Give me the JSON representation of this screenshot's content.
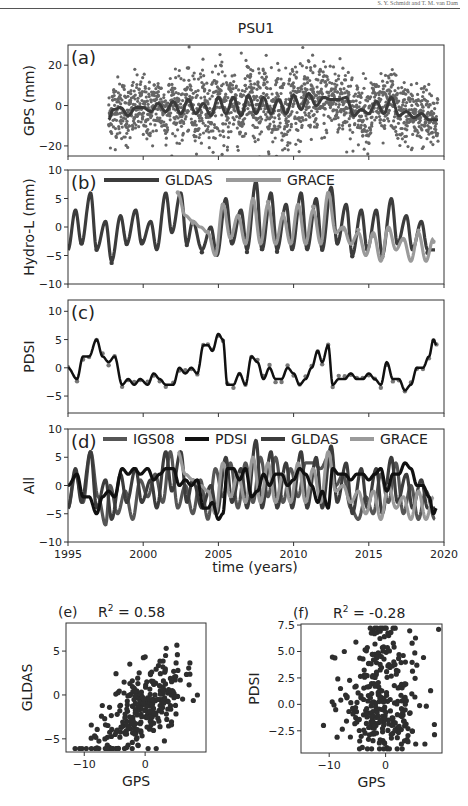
{
  "header": {
    "running_text": "S. Y. Schmidt and T. M. van Dam"
  },
  "figure": {
    "title": "PSU1",
    "xlabel_time": "time (years)",
    "colors": {
      "gps_dots": "#666666",
      "gps_fit": "#3a3a3a",
      "gldas": "#3c3c3c",
      "grace": "#9a9a9a",
      "pdsi": "#111111",
      "pdsi_dots": "#777777",
      "igs08": "#555555",
      "scatter": "#2e2e2e"
    }
  },
  "chart_data": [
    {
      "id": "a",
      "type": "scatter",
      "panel_label": "(a)",
      "title": "PSU1",
      "ylabel": "GPS (mm)",
      "xlabel": "",
      "xlim": [
        1995,
        2020
      ],
      "ylim": [
        -25,
        30
      ],
      "yticks": [
        -20,
        0,
        20
      ],
      "xticks": [
        1995,
        2000,
        2005,
        2010,
        2015,
        2020
      ],
      "series": [
        {
          "name": "GPS daily",
          "style": "dots",
          "x_range": [
            1997.7,
            2019.6
          ],
          "spread_mm": 9
        },
        {
          "name": "GPS smoothed",
          "style": "line",
          "x": [
            1997.7,
            1998.0,
            1998.5,
            1999.0,
            1999.5,
            2000.0,
            2000.5,
            2001.0,
            2001.5,
            2002.0,
            2002.5,
            2003.0,
            2003.5,
            2004.0,
            2004.5,
            2005.0,
            2005.5,
            2006.0,
            2006.5,
            2007.0,
            2007.5,
            2008.0,
            2008.5,
            2009.0,
            2009.5,
            2010.0,
            2010.5,
            2011.0,
            2011.5,
            2012.0,
            2012.5,
            2013.0,
            2013.5,
            2014.0,
            2014.5,
            2015.0,
            2015.5,
            2016.0,
            2016.5,
            2017.0,
            2017.5,
            2018.0,
            2018.5,
            2019.0,
            2019.6
          ],
          "y": [
            -7,
            -2,
            -1,
            -5,
            -1,
            -1,
            -3,
            1,
            -3,
            2,
            -4,
            3,
            -4,
            1,
            -5,
            4,
            -4,
            4,
            -5,
            5,
            -4,
            4,
            -4,
            3,
            -4,
            5,
            -2,
            6,
            0,
            4,
            3,
            3,
            4,
            -5,
            -2,
            -4,
            2,
            -4,
            4,
            -5,
            -3,
            -6,
            -4,
            -7,
            -7
          ]
        }
      ],
      "grid": false
    },
    {
      "id": "b",
      "type": "line",
      "panel_label": "(b)",
      "ylabel": "Hydro-L (mm)",
      "xlim": [
        1995,
        2020
      ],
      "ylim": [
        -10,
        10
      ],
      "yticks": [
        -10,
        -5,
        0,
        5,
        10
      ],
      "xticks": [
        1995,
        2000,
        2005,
        2010,
        2015,
        2020
      ],
      "legend": {
        "entries": [
          "GLDAS",
          "GRACE"
        ],
        "position": "top"
      },
      "series": [
        {
          "name": "GLDAS",
          "x": [
            1995.0,
            1995.5,
            1995.9,
            1996.5,
            1996.9,
            1997.5,
            1997.9,
            1998.5,
            1998.9,
            1999.5,
            1999.9,
            2000.5,
            2000.9,
            2001.5,
            2001.9,
            2002.5,
            2002.9,
            2003.3,
            2003.9,
            2004.5,
            2004.9,
            2005.5,
            2005.9,
            2006.5,
            2006.9,
            2007.5,
            2007.9,
            2008.5,
            2008.9,
            2009.5,
            2009.9,
            2010.5,
            2010.9,
            2011.5,
            2011.9,
            2012.5,
            2012.9,
            2013.5,
            2013.9,
            2014.5,
            2014.9,
            2015.5,
            2015.9,
            2016.5,
            2016.9,
            2017.5,
            2017.9,
            2018.5,
            2018.9,
            2019.4
          ],
          "y": [
            -4,
            3,
            -3,
            6,
            -4,
            1,
            -6,
            2,
            -3,
            3,
            -3,
            1,
            -4,
            6,
            -1,
            6,
            -3,
            1,
            -4,
            0,
            -5,
            5,
            -3,
            3,
            -4,
            8,
            -4,
            6,
            -4,
            4,
            -4,
            6,
            -4,
            5,
            -4,
            7,
            -3,
            4,
            -5,
            3,
            -4,
            3,
            -5,
            5,
            -3,
            2,
            -4,
            1,
            -4,
            -4
          ]
        },
        {
          "name": "GRACE",
          "x": [
            2002.3,
            2002.8,
            2003.3,
            2003.8,
            2004.3,
            2004.8,
            2005.3,
            2005.8,
            2006.3,
            2006.8,
            2007.3,
            2007.8,
            2008.3,
            2008.8,
            2009.3,
            2009.8,
            2010.3,
            2010.8,
            2011.3,
            2011.8,
            2012.3,
            2012.8,
            2013.3,
            2013.8,
            2014.3,
            2014.8,
            2015.3,
            2015.8,
            2016.3,
            2016.8,
            2017.3,
            2017.8,
            2018.3,
            2018.8,
            2019.3
          ],
          "y": [
            6,
            2,
            1,
            0,
            -1,
            -5,
            4,
            -2,
            2,
            -3,
            5,
            -3,
            4,
            -3,
            2,
            -3,
            4,
            -3,
            3,
            -3,
            6,
            -1,
            0,
            -3,
            -1,
            -5,
            -1,
            -6,
            0,
            -4,
            -2,
            -6,
            -1,
            -6,
            -2
          ]
        }
      ]
    },
    {
      "id": "c",
      "type": "line",
      "panel_label": "(c)",
      "ylabel": "PDSI",
      "xlim": [
        1995,
        2020
      ],
      "ylim": [
        -8,
        12
      ],
      "yticks": [
        -5,
        0,
        5,
        10
      ],
      "xticks": [
        1995,
        2000,
        2005,
        2010,
        2015,
        2020
      ],
      "series": [
        {
          "name": "PDSI",
          "x": [
            1995.0,
            1995.6,
            1996.0,
            1996.4,
            1996.9,
            1997.3,
            1997.7,
            1998.1,
            1998.6,
            1999.0,
            1999.4,
            1999.8,
            2000.3,
            2000.7,
            2001.1,
            2001.5,
            2002.0,
            2002.4,
            2002.8,
            2003.2,
            2003.6,
            2004.0,
            2004.3,
            2004.6,
            2005.0,
            2005.3,
            2005.6,
            2006.0,
            2006.4,
            2006.8,
            2007.2,
            2007.6,
            2008.0,
            2008.4,
            2008.8,
            2009.2,
            2009.6,
            2010.0,
            2010.4,
            2010.8,
            2011.2,
            2011.6,
            2011.9,
            2012.3,
            2012.6,
            2013.0,
            2013.4,
            2013.8,
            2014.2,
            2014.6,
            2015.0,
            2015.4,
            2015.8,
            2016.2,
            2016.6,
            2017.0,
            2017.4,
            2017.8,
            2018.2,
            2018.6,
            2019.0,
            2019.3,
            2019.5
          ],
          "y": [
            0,
            -2,
            2,
            2,
            5,
            2,
            1,
            2,
            -3,
            -2,
            -3,
            -2,
            -3,
            -1,
            -2,
            -3,
            -3,
            0,
            -1,
            0,
            -1,
            4,
            4,
            3,
            6,
            5,
            -3,
            -3,
            -1,
            -3,
            2,
            1,
            -2,
            0,
            -2,
            -2,
            0,
            -1,
            -3,
            -2,
            0,
            3,
            1,
            4,
            -3,
            -2,
            -2,
            -1,
            -2,
            -2,
            -1,
            -2,
            -3,
            1,
            -2,
            -2,
            -4,
            -3,
            0,
            0,
            2,
            5,
            4
          ]
        }
      ]
    },
    {
      "id": "d",
      "type": "line",
      "panel_label": "(d)",
      "ylabel": "All",
      "xlabel": "time (years)",
      "xlim": [
        1995,
        2020
      ],
      "ylim": [
        -10,
        10
      ],
      "yticks": [
        -10,
        -5,
        0,
        5,
        10
      ],
      "xticks": [
        1995,
        2000,
        2005,
        2010,
        2015,
        2020
      ],
      "xticklabels": [
        "1995",
        "2000",
        "2005",
        "2010",
        "2015",
        "2020"
      ],
      "legend": {
        "entries": [
          "IGS08",
          "PDSI",
          "GLDAS",
          "GRACE"
        ],
        "position": "top"
      },
      "series": [
        {
          "name": "IGS08",
          "x": [
            1995.0,
            1995.5,
            1996.0,
            1996.5,
            1997.0,
            1997.5,
            1997.8,
            1998.3,
            1998.8,
            1999.3,
            1999.8,
            2000.3,
            2000.8,
            2001.3,
            2001.8,
            2002.3,
            2002.8,
            2003.3,
            2003.8,
            2004.3,
            2004.8,
            2005.3,
            2005.8,
            2006.3,
            2006.8,
            2007.3,
            2007.8,
            2008.3,
            2008.8,
            2009.3,
            2009.8,
            2010.3,
            2010.8,
            2011.3,
            2011.8,
            2012.3,
            2012.8,
            2013.3,
            2013.8,
            2014.3,
            2014.8,
            2015.3,
            2015.8,
            2016.3,
            2016.8,
            2017.3,
            2017.8,
            2018.3,
            2018.8,
            2019.4
          ],
          "y": [
            -4,
            2,
            -3,
            6,
            -2,
            -7,
            0,
            -5,
            -1,
            -6,
            1,
            -2,
            2,
            -3,
            6,
            -4,
            0,
            -5,
            1,
            -6,
            3,
            -2,
            4,
            -4,
            4,
            -3,
            5,
            -2,
            5,
            -3,
            3,
            -2,
            4,
            4,
            3,
            5,
            0,
            2,
            -4,
            -6,
            -2,
            -5,
            2,
            -3,
            4,
            -5,
            0,
            -6,
            -1,
            -6
          ]
        },
        {
          "name": "PDSI",
          "x": [
            1995.0,
            1995.6,
            1996.0,
            1996.4,
            1996.9,
            1997.3,
            1997.7,
            1998.1,
            1998.6,
            1999.0,
            1999.4,
            1999.8,
            2000.3,
            2000.7,
            2001.1,
            2001.5,
            2002.0,
            2002.4,
            2002.8,
            2003.2,
            2003.6,
            2004.0,
            2004.3,
            2004.6,
            2005.0,
            2005.3,
            2005.6,
            2006.0,
            2006.4,
            2006.8,
            2007.2,
            2007.6,
            2008.0,
            2008.4,
            2008.8,
            2009.2,
            2009.6,
            2010.0,
            2010.4,
            2010.8,
            2011.2,
            2011.6,
            2011.9,
            2012.3,
            2012.6,
            2013.0,
            2013.4,
            2013.8,
            2014.2,
            2014.6,
            2015.0,
            2015.4,
            2015.8,
            2016.2,
            2016.6,
            2017.0,
            2017.4,
            2017.8,
            2018.2,
            2018.6,
            2019.0,
            2019.3,
            2019.5
          ],
          "y": [
            0,
            2,
            -2,
            -2,
            -5,
            -2,
            -1,
            -2,
            3,
            2,
            3,
            2,
            3,
            1,
            2,
            3,
            3,
            0,
            1,
            0,
            1,
            -4,
            -4,
            -3,
            -6,
            -5,
            3,
            3,
            1,
            3,
            -2,
            -1,
            2,
            0,
            2,
            2,
            0,
            1,
            3,
            2,
            0,
            -3,
            -1,
            -4,
            3,
            2,
            2,
            1,
            2,
            2,
            1,
            2,
            3,
            -1,
            2,
            2,
            4,
            3,
            0,
            0,
            -2,
            -5,
            -4
          ]
        },
        {
          "name": "GLDAS",
          "x": [
            1995.0,
            1995.5,
            1995.9,
            1996.5,
            1996.9,
            1997.5,
            1997.9,
            1998.5,
            1998.9,
            1999.5,
            1999.9,
            2000.5,
            2000.9,
            2001.5,
            2001.9,
            2002.5,
            2002.9,
            2003.3,
            2003.9,
            2004.5,
            2004.9,
            2005.5,
            2005.9,
            2006.5,
            2006.9,
            2007.5,
            2007.9,
            2008.5,
            2008.9,
            2009.5,
            2009.9,
            2010.5,
            2010.9,
            2011.5,
            2011.9,
            2012.5,
            2012.9,
            2013.5,
            2013.9,
            2014.5,
            2014.9,
            2015.5,
            2015.9,
            2016.5,
            2016.9,
            2017.5,
            2017.9,
            2018.5,
            2018.9,
            2019.4
          ],
          "y": [
            -4,
            3,
            -3,
            6,
            -4,
            1,
            -6,
            2,
            -3,
            3,
            -3,
            1,
            -4,
            6,
            -1,
            6,
            -3,
            1,
            -4,
            0,
            -5,
            5,
            -3,
            3,
            -4,
            8,
            -4,
            6,
            -4,
            4,
            -4,
            6,
            -4,
            5,
            -4,
            7,
            -3,
            4,
            -5,
            3,
            -4,
            3,
            -5,
            5,
            -3,
            2,
            -4,
            1,
            -4,
            -4
          ]
        },
        {
          "name": "GRACE",
          "x": [
            2002.3,
            2002.8,
            2003.3,
            2003.8,
            2004.3,
            2004.8,
            2005.3,
            2005.8,
            2006.3,
            2006.8,
            2007.3,
            2007.8,
            2008.3,
            2008.8,
            2009.3,
            2009.8,
            2010.3,
            2010.8,
            2011.3,
            2011.8,
            2012.3,
            2012.8,
            2013.3,
            2013.8,
            2014.3,
            2014.8,
            2015.3,
            2015.8,
            2016.3,
            2016.8,
            2017.3,
            2017.8,
            2018.3,
            2018.8,
            2019.3
          ],
          "y": [
            6,
            2,
            1,
            0,
            -1,
            -5,
            4,
            -2,
            2,
            -3,
            5,
            -3,
            4,
            -3,
            2,
            -3,
            4,
            -3,
            3,
            -3,
            6,
            -1,
            0,
            -3,
            -1,
            -5,
            -1,
            -6,
            0,
            -4,
            -2,
            -6,
            -1,
            -6,
            -2
          ]
        }
      ]
    },
    {
      "id": "e",
      "type": "scatter",
      "panel_label": "(e)",
      "title": "R² = 0.58",
      "title_base": "R",
      "title_sup": "2",
      "title_rest": " = 0.58",
      "xlabel": "GPS",
      "ylabel": "GLDAS",
      "xlim": [
        -13,
        10
      ],
      "ylim": [
        -6.5,
        8.2
      ],
      "xticks": [
        -10,
        0
      ],
      "yticks": [
        -5,
        0,
        5
      ],
      "r_squared": 0.58,
      "n_points": 300,
      "trend": "positive"
    },
    {
      "id": "f",
      "type": "scatter",
      "panel_label": "(f)",
      "title": "R² = -0.28",
      "title_base": "R",
      "title_sup": "2",
      "title_rest": " = -0.28",
      "xlabel": "GPS",
      "ylabel": "PDSI",
      "xlim": [
        -15,
        10
      ],
      "ylim": [
        -4.6,
        7.6
      ],
      "xticks": [
        -10,
        0
      ],
      "yticks": [
        -2.5,
        0.0,
        2.5,
        5.0,
        7.5
      ],
      "yticklabels": [
        "−2.5",
        "0.0",
        "2.5",
        "5.0",
        "7.5"
      ],
      "r_squared": -0.28,
      "n_points": 300,
      "trend": "negative"
    }
  ]
}
